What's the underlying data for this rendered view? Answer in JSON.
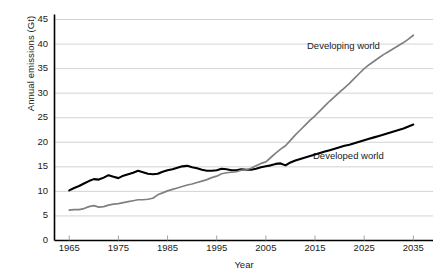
{
  "chart_data": {
    "type": "line",
    "title": "",
    "xlabel": "Year",
    "ylabel": "Annual emissions (Gt)",
    "xlim": [
      1962,
      2039
    ],
    "ylim": [
      0,
      45
    ],
    "xticks": [
      1965,
      1975,
      1985,
      1995,
      2005,
      2015,
      2025,
      2035
    ],
    "yticks": [
      0,
      5,
      10,
      15,
      20,
      25,
      30,
      35,
      40,
      45
    ],
    "grid": "horizontal",
    "legend_position": "inline-annotations",
    "colors": {
      "developed": "#000000",
      "developing": "#808080",
      "gridline": "#c8c8c8",
      "axis": "#000000",
      "background": "#ffffff"
    },
    "series": [
      {
        "name": "Developed world",
        "color": "#000000",
        "annotation": "Developed world",
        "x": [
          1965,
          1966,
          1967,
          1968,
          1969,
          1970,
          1971,
          1972,
          1973,
          1974,
          1975,
          1976,
          1977,
          1978,
          1979,
          1980,
          1981,
          1982,
          1983,
          1984,
          1985,
          1986,
          1987,
          1988,
          1989,
          1990,
          1991,
          1992,
          1993,
          1994,
          1995,
          1996,
          1997,
          1998,
          1999,
          2000,
          2001,
          2002,
          2003,
          2004,
          2005,
          2006,
          2007,
          2008,
          2009,
          2010,
          2011,
          2012,
          2013,
          2014,
          2015,
          2016,
          2017,
          2018,
          2019,
          2020,
          2021,
          2022,
          2023,
          2024,
          2025,
          2026,
          2027,
          2028,
          2029,
          2030,
          2031,
          2032,
          2033,
          2034,
          2035
        ],
        "y": [
          10.2,
          10.7,
          11.1,
          11.6,
          12.1,
          12.5,
          12.4,
          12.8,
          13.3,
          13.0,
          12.7,
          13.2,
          13.5,
          13.8,
          14.2,
          13.9,
          13.6,
          13.5,
          13.6,
          14.0,
          14.3,
          14.5,
          14.8,
          15.1,
          15.2,
          14.9,
          14.7,
          14.4,
          14.2,
          14.2,
          14.3,
          14.6,
          14.5,
          14.3,
          14.3,
          14.5,
          14.4,
          14.4,
          14.6,
          14.9,
          15.1,
          15.3,
          15.6,
          15.7,
          15.3,
          15.9,
          16.3,
          16.6,
          16.9,
          17.2,
          17.5,
          17.8,
          18.1,
          18.4,
          18.7,
          19.0,
          19.3,
          19.5,
          19.8,
          20.1,
          20.4,
          20.7,
          21.0,
          21.3,
          21.6,
          21.9,
          22.2,
          22.5,
          22.8,
          23.2,
          23.6
        ]
      },
      {
        "name": "Developing world",
        "color": "#808080",
        "annotation": "Developing world",
        "x": [
          1965,
          1966,
          1967,
          1968,
          1969,
          1970,
          1971,
          1972,
          1973,
          1974,
          1975,
          1976,
          1977,
          1978,
          1979,
          1980,
          1981,
          1982,
          1983,
          1984,
          1985,
          1986,
          1987,
          1988,
          1989,
          1990,
          1991,
          1992,
          1993,
          1994,
          1995,
          1996,
          1997,
          1998,
          1999,
          2000,
          2001,
          2002,
          2003,
          2004,
          2005,
          2006,
          2007,
          2008,
          2009,
          2010,
          2011,
          2012,
          2013,
          2014,
          2015,
          2016,
          2017,
          2018,
          2019,
          2020,
          2021,
          2022,
          2023,
          2024,
          2025,
          2026,
          2027,
          2028,
          2029,
          2030,
          2031,
          2032,
          2033,
          2034,
          2035
        ],
        "y": [
          6.2,
          6.3,
          6.3,
          6.5,
          6.9,
          7.1,
          6.8,
          6.9,
          7.2,
          7.4,
          7.5,
          7.7,
          7.9,
          8.1,
          8.3,
          8.3,
          8.4,
          8.6,
          9.3,
          9.7,
          10.1,
          10.4,
          10.7,
          11.0,
          11.3,
          11.5,
          11.8,
          12.1,
          12.4,
          12.8,
          13.1,
          13.6,
          13.8,
          13.9,
          14.0,
          14.3,
          14.4,
          14.7,
          15.2,
          15.7,
          16.0,
          16.9,
          17.8,
          18.6,
          19.3,
          20.4,
          21.5,
          22.5,
          23.5,
          24.5,
          25.4,
          26.4,
          27.4,
          28.4,
          29.3,
          30.2,
          31.1,
          32.0,
          33.0,
          34.0,
          35.0,
          35.8,
          36.5,
          37.2,
          37.9,
          38.5,
          39.1,
          39.7,
          40.3,
          41.0,
          41.8
        ]
      }
    ]
  },
  "axes": {
    "y_title": "Annual emissions (Gt)",
    "x_title": "Year",
    "y_tick_labels": [
      "45",
      "40",
      "35",
      "30",
      "25",
      "20",
      "15",
      "10",
      "5",
      "0"
    ],
    "x_tick_labels": [
      "1965",
      "1975",
      "1985",
      "1995",
      "2005",
      "2015",
      "2025",
      "2035"
    ]
  },
  "annotations": {
    "developing": "Developing world",
    "developed": "Developed world"
  }
}
